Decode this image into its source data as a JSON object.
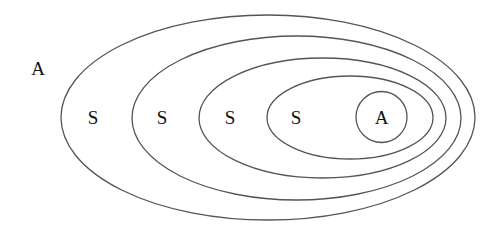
{
  "diagram": {
    "type": "nested-sets",
    "outer_label": {
      "text": "A",
      "x": 38,
      "y": 68
    },
    "ellipses": [
      {
        "name": "level-1",
        "cx": 268,
        "cy": 117.5,
        "rx": 207,
        "ry": 102.5,
        "label": "S",
        "label_x": 93,
        "label_y": 117
      },
      {
        "name": "level-2",
        "cx": 296.5,
        "cy": 118,
        "rx": 164.5,
        "ry": 82,
        "label": "S",
        "label_x": 162,
        "label_y": 117
      },
      {
        "name": "level-3",
        "cx": 322.5,
        "cy": 118,
        "rx": 123.5,
        "ry": 60,
        "label": "S",
        "label_x": 230,
        "label_y": 117
      },
      {
        "name": "level-4",
        "cx": 350,
        "cy": 117.5,
        "rx": 83,
        "ry": 41.5,
        "label": "S",
        "label_x": 296,
        "label_y": 117
      }
    ],
    "inner_circle": {
      "cx": 381.5,
      "cy": 117,
      "r": 25.5,
      "label": "A"
    },
    "stroke_color": "#555555",
    "text_color": "#111111",
    "background": "#ffffff"
  }
}
